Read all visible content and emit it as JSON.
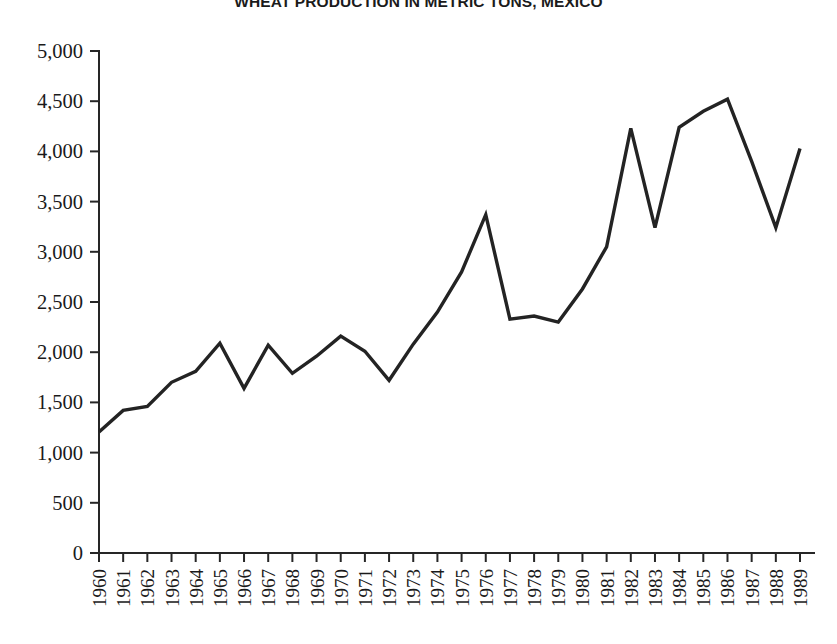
{
  "chart_data": {
    "type": "line",
    "title": "WHEAT PRODUCTION IN METRIC TONS, MEXICO",
    "xlabel": "",
    "ylabel": "",
    "ylim": [
      0,
      5000
    ],
    "ytick_labels": [
      "5,000",
      "4,500",
      "4,000",
      "3,500",
      "3,000",
      "2,500",
      "2,000",
      "1,500",
      "1,000",
      "500",
      "0"
    ],
    "ytick_values": [
      5000,
      4500,
      4000,
      3500,
      3000,
      2500,
      2000,
      1500,
      1000,
      500,
      0
    ],
    "grid": false,
    "legend": "none",
    "x_label_rotation": -90,
    "categories": [
      "1960",
      "1961",
      "1962",
      "1963",
      "1964",
      "1965",
      "1966",
      "1967",
      "1968",
      "1969",
      "1970",
      "1971",
      "1972",
      "1973",
      "1974",
      "1975",
      "1976",
      "1977",
      "1978",
      "1979",
      "1980",
      "1981",
      "1982",
      "1983",
      "1984",
      "1985",
      "1986",
      "1987",
      "1988",
      "1989"
    ],
    "values": [
      1205,
      1420,
      1460,
      1700,
      1810,
      2090,
      1640,
      2070,
      1790,
      1960,
      2160,
      2010,
      1720,
      2080,
      2400,
      2800,
      3370,
      2330,
      2360,
      2300,
      2630,
      3050,
      4230,
      3240,
      4240,
      4400,
      4520,
      3900,
      3240,
      4030
    ],
    "series": [
      {
        "name": "Wheat production",
        "values": [
          1205,
          1420,
          1460,
          1700,
          1810,
          2090,
          1640,
          2070,
          1790,
          1960,
          2160,
          2010,
          1720,
          2080,
          2400,
          2800,
          3370,
          2330,
          2360,
          2300,
          2630,
          3050,
          4230,
          3240,
          4240,
          4400,
          4520,
          3900,
          3240,
          4030
        ],
        "color": "#232323"
      }
    ]
  }
}
